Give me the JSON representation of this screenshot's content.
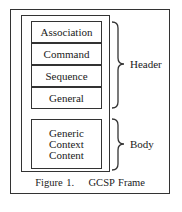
{
  "figure": {
    "caption": "Figure 1.    GCSP Frame",
    "header_fields": [
      "Association",
      "Command",
      "Sequence",
      "General"
    ],
    "body_field": "Generic Context Content",
    "body_lines": [
      "Generic",
      "Context",
      "Content"
    ],
    "brace_labels": {
      "header": "Header",
      "body": "Body"
    }
  }
}
